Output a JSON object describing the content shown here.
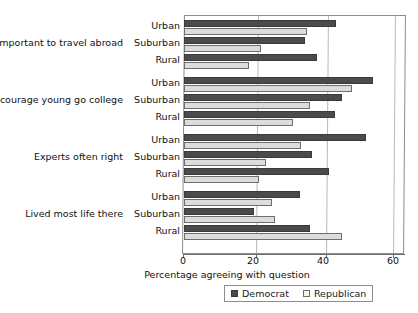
{
  "chart_data": {
    "type": "bar",
    "orientation": "horizontal",
    "title": "",
    "xlabel": "Percentage agreeing with question",
    "ylabel": "",
    "xlim": [
      0,
      60
    ],
    "xticks": [
      0,
      20,
      40,
      60
    ],
    "xtick_labels": [
      "0",
      "20",
      "40",
      "60"
    ],
    "grid": true,
    "grid_axis": "x",
    "legend_position": "bottom-center",
    "groups": [
      "Important to travel abroad",
      "Encourage young go college",
      "Experts often right",
      "Lived most life there"
    ],
    "subcategories": [
      "Urban",
      "Suburban",
      "Rural"
    ],
    "categories": [
      "Important to travel abroad - Urban",
      "Important to travel abroad - Suburban",
      "Important to travel abroad - Rural",
      "Encourage young go college - Urban",
      "Encourage young go college - Suburban",
      "Encourage young go college - Rural",
      "Experts often right - Urban",
      "Experts often right - Suburban",
      "Experts often right - Rural",
      "Lived most life there - Urban",
      "Lived most life there - Suburban",
      "Lived most life there - Rural"
    ],
    "series": [
      {
        "name": "Democrat",
        "color": "#4b4b4b",
        "values": [
          43.5,
          34.5,
          38,
          54,
          45,
          43,
          52,
          36.5,
          41.5,
          33,
          20,
          36
        ]
      },
      {
        "name": "Republican",
        "color": "#dcdcdc",
        "values": [
          35,
          22,
          18.5,
          48,
          36,
          31,
          33.5,
          23.5,
          21.5,
          25,
          26,
          45
        ]
      }
    ]
  },
  "legend": {
    "entries": [
      {
        "label": "Democrat",
        "swatch": "dark-square-swatch"
      },
      {
        "label": "Republican",
        "swatch": "light-square-swatch"
      }
    ]
  },
  "axis": {
    "x_title": "Percentage agreeing with question"
  }
}
